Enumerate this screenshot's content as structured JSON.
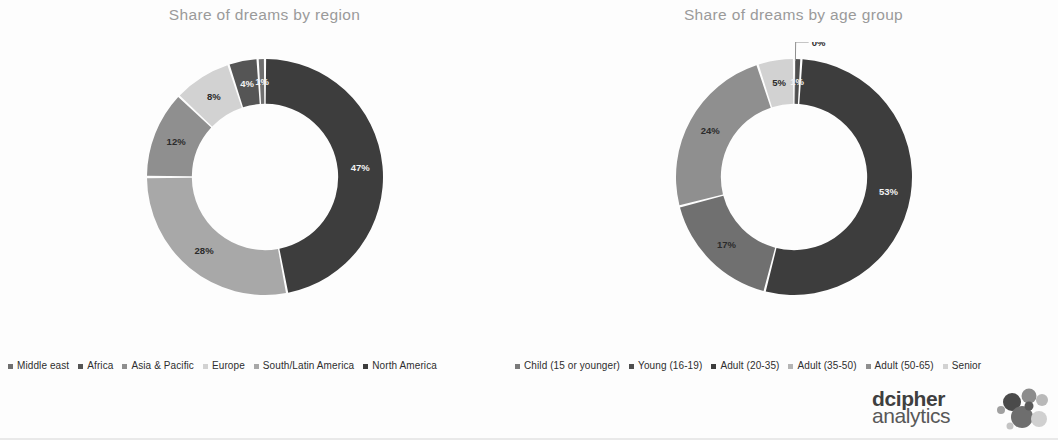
{
  "page": {
    "background": "#ffffff"
  },
  "logo": {
    "name": "dcipher-analytics-logo",
    "line1": "dcipher",
    "line2": "analytics",
    "dot_colors": [
      "#4a4a4a",
      "#8c8c8c",
      "#b9b9b9",
      "#6e6e6e",
      "#d0d0d0",
      "#a0a0a0",
      "#5a5a5a",
      "#c4c4c4"
    ]
  },
  "charts": [
    {
      "id": "share-by-region",
      "title": "Share of dreams by region",
      "legend_position": "bottom"
    },
    {
      "id": "share-by-age-group",
      "title": "Share of dreams by age group",
      "legend_position": "bottom"
    }
  ],
  "chart_data": [
    {
      "type": "pie",
      "variant": "donut",
      "title": "Share of dreams by region",
      "xlabel": "",
      "ylabel": "",
      "legend_position": "bottom",
      "grid": false,
      "hole_ratio": 0.62,
      "start_angle_deg": 0,
      "direction": "clockwise",
      "labels_suffix": "%",
      "categories": [
        "Middle east",
        "Africa",
        "Asia & Pacific",
        "Europe",
        "South/Latin America",
        "North America"
      ],
      "values": [
        1,
        4,
        8,
        12,
        28,
        47
      ],
      "display_labels": [
        "1%",
        "4%",
        "8%",
        "12%",
        "28%",
        "47%"
      ],
      "colors": [
        "#6f6f6f",
        "#555555",
        "#d2d2d2",
        "#8f8f8f",
        "#a8a8a8",
        "#3d3d3d"
      ],
      "slices": [
        {
          "name": "Middle east",
          "value": 1,
          "label": "1%",
          "color": "#6f6f6f",
          "label_tone": "ondark",
          "callout": false
        },
        {
          "name": "Africa",
          "value": 4,
          "label": "4%",
          "color": "#555555",
          "label_tone": "ondark",
          "callout": false
        },
        {
          "name": "Asia & Pacific",
          "value": 8,
          "label": "8%",
          "color": "#d2d2d2",
          "label_tone": "onlight",
          "callout": false
        },
        {
          "name": "Europe",
          "value": 12,
          "label": "12%",
          "color": "#8f8f8f",
          "label_tone": "onlight",
          "callout": false
        },
        {
          "name": "South/Latin America",
          "value": 28,
          "label": "28%",
          "color": "#a8a8a8",
          "label_tone": "onlight",
          "callout": false
        },
        {
          "name": "North America",
          "value": 47,
          "label": "47%",
          "color": "#3d3d3d",
          "label_tone": "ondark",
          "callout": false
        }
      ],
      "render_order": [
        "North America",
        "South/Latin America",
        "Europe",
        "Asia & Pacific",
        "Africa",
        "Middle east"
      ]
    },
    {
      "type": "pie",
      "variant": "donut",
      "title": "Share of dreams by age group",
      "xlabel": "",
      "ylabel": "",
      "legend_position": "bottom",
      "grid": false,
      "hole_ratio": 0.62,
      "start_angle_deg": 0,
      "direction": "clockwise",
      "labels_suffix": "%",
      "categories": [
        "Child (15 or younger)",
        "Young (16-19)",
        "Adult (20-35)",
        "Adult (35-50)",
        "Adult (50-65)",
        "Senior"
      ],
      "values": [
        0,
        1,
        53,
        17,
        24,
        5
      ],
      "display_labels": [
        "0%",
        "1%",
        "53%",
        "17%",
        "24%",
        "5%"
      ],
      "colors": [
        "#7a7a7a",
        "#4f4f4f",
        "#3d3d3d",
        "#707070",
        "#8f8f8f",
        "#d2d2d2"
      ],
      "slices": [
        {
          "name": "Child (15 or younger)",
          "value": 0,
          "label": "0%",
          "color": "#7a7a7a",
          "label_tone": "onlight",
          "callout": true
        },
        {
          "name": "Young (16-19)",
          "value": 1,
          "label": "1%",
          "color": "#4f4f4f",
          "label_tone": "ondark",
          "callout": false
        },
        {
          "name": "Adult (20-35)",
          "value": 53,
          "label": "53%",
          "color": "#3d3d3d",
          "label_tone": "ondark",
          "callout": false
        },
        {
          "name": "Adult (35-50)",
          "value": 17,
          "label": "17%",
          "color": "#707070",
          "label_tone": "onlight",
          "callout": false
        },
        {
          "name": "Adult (50-65)",
          "value": 24,
          "label": "24%",
          "color": "#8f8f8f",
          "label_tone": "onlight",
          "callout": false
        },
        {
          "name": "Senior",
          "value": 5,
          "label": "5%",
          "color": "#d2d2d2",
          "label_tone": "onlight",
          "callout": false
        }
      ],
      "render_order": [
        "Young (16-19)",
        "Adult (20-35)",
        "Adult (35-50)",
        "Adult (50-65)",
        "Senior",
        "Child (15 or younger)"
      ]
    }
  ],
  "legends": [
    {
      "id": "legend-region",
      "items": [
        {
          "label": "Middle east",
          "color": "#6f6f6f"
        },
        {
          "label": "Africa",
          "color": "#555555"
        },
        {
          "label": "Asia & Pacific",
          "color": "#8f8f8f"
        },
        {
          "label": "Europe",
          "color": "#d2d2d2"
        },
        {
          "label": "South/Latin America",
          "color": "#a8a8a8"
        },
        {
          "label": "North America",
          "color": "#3d3d3d"
        }
      ]
    },
    {
      "id": "legend-age-group",
      "items": [
        {
          "label": "Child (15 or younger)",
          "color": "#7a7a7a"
        },
        {
          "label": "Young (16-19)",
          "color": "#4f4f4f"
        },
        {
          "label": "Adult (20-35)",
          "color": "#3d3d3d"
        },
        {
          "label": "Adult (35-50)",
          "color": "#b5b5b5"
        },
        {
          "label": "Adult (50-65)",
          "color": "#8f8f8f"
        },
        {
          "label": "Senior",
          "color": "#d2d2d2"
        }
      ]
    }
  ]
}
